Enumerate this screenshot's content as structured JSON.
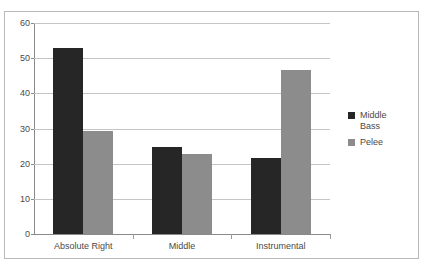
{
  "chart_data": {
    "type": "bar",
    "title": "",
    "subtitle": "",
    "xlabel": "",
    "ylabel": "",
    "categories": [
      "Absolute Right",
      "Middle",
      "Instrumental"
    ],
    "series": [
      {
        "name": "Middle Bass",
        "color": "#262626",
        "values": [
          53,
          24.7,
          21.6
        ]
      },
      {
        "name": "Pelee",
        "color": "#8c8c8c",
        "values": [
          29.3,
          22.7,
          46.6
        ]
      }
    ],
    "ylim": [
      0,
      60
    ],
    "y_ticks": [
      0,
      10,
      20,
      30,
      40,
      50,
      60
    ],
    "y_tick_labels": [
      "0",
      "10",
      "20",
      "30",
      "40",
      "50",
      "60"
    ],
    "grid": true,
    "grid_axis": "y",
    "legend": true,
    "legend_position": "right",
    "background": "#ffffff",
    "frame_color": "#b9b9b9"
  }
}
